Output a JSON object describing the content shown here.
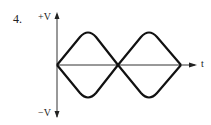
{
  "problem_number": "4.",
  "axes": {
    "y_positive_label": "+V",
    "y_negative_label": "−V",
    "x_label": "t"
  },
  "diagram": {
    "curves": [
      {
        "name": "upper",
        "points": [
          [
            57,
            65
          ],
          [
            88,
            32
          ],
          [
            118,
            65
          ],
          [
            149,
            32
          ],
          [
            181,
            65
          ]
        ]
      },
      {
        "name": "lower",
        "points": [
          [
            57,
            65
          ],
          [
            88,
            97
          ],
          [
            118,
            65
          ],
          [
            149,
            97
          ],
          [
            181,
            65
          ]
        ]
      }
    ],
    "stroke_color": "#111111",
    "axis_color": "#333333"
  }
}
